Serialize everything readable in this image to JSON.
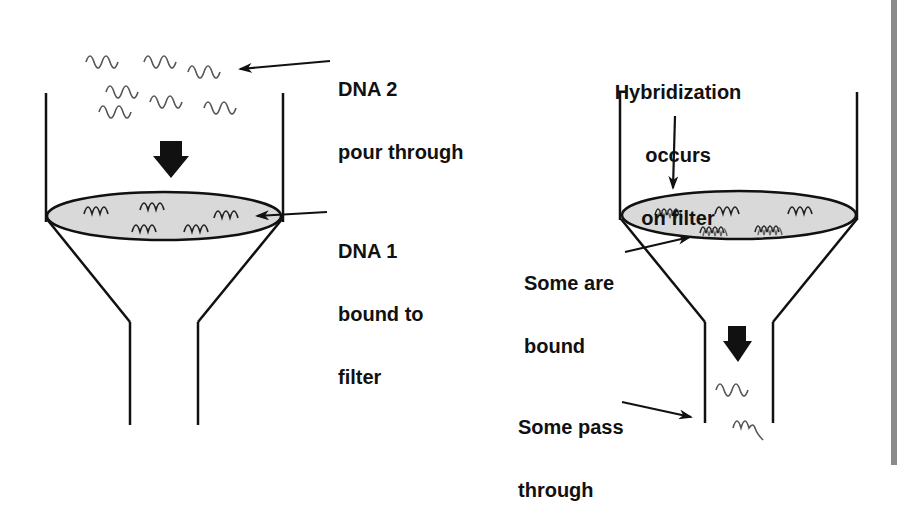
{
  "diagram": {
    "colors": {
      "line": "#111111",
      "filter_fill": "#d9d9d9",
      "dna_strand": "#555555",
      "side_bar": "#8a8a8a",
      "background": "#ffffff"
    },
    "left_panel": {
      "label_dna2_line1": "DNA 2",
      "label_dna2_line2": "pour through",
      "label_dna1_line1": "DNA 1",
      "label_dna1_line2": "bound to",
      "label_dna1_line3": "filter",
      "free_strands_count": 8,
      "bound_strands_count": 6
    },
    "right_panel": {
      "label_hybrid_line1": "Hybridization",
      "label_hybrid_line2": "occurs",
      "label_hybrid_line3": "on filter",
      "label_bound_line1": "Some are",
      "label_bound_line2": "bound",
      "label_pass_line1": "Some pass",
      "label_pass_line2": "through",
      "hybrid_strands_count": 3,
      "single_strands_on_filter_count": 2,
      "passed_strands_count": 2
    }
  }
}
